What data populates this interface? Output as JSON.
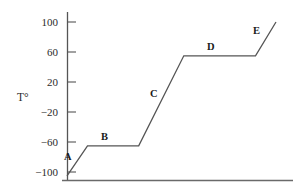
{
  "chart_data": {
    "type": "line",
    "title": "",
    "subtitle": "",
    "xlabel": "",
    "ylabel": "T°",
    "grid": false,
    "legend_position": "none",
    "ylim": [
      -110,
      110
    ],
    "yticks": [
      100,
      60,
      20,
      -20,
      -60,
      -100
    ],
    "ytick_labels": [
      "100",
      "60",
      "20",
      "−20",
      "−60",
      "−100"
    ],
    "xticks": [],
    "xtick_labels": [],
    "x_axis_visible": true,
    "y_axis_visible": true,
    "series": [
      {
        "name": "heating-curve",
        "points": [
          {
            "x": 0,
            "y": -105
          },
          {
            "x": 10,
            "y": -65
          },
          {
            "x": 35,
            "y": -65
          },
          {
            "x": 57,
            "y": 55
          },
          {
            "x": 92,
            "y": 55
          },
          {
            "x": 102,
            "y": 100
          }
        ]
      }
    ],
    "annotations": [
      {
        "label": "A",
        "x": 2,
        "y": -88
      },
      {
        "label": "B",
        "x": 20,
        "y": -53
      },
      {
        "label": "C",
        "x": 44,
        "y": 10
      },
      {
        "label": "D",
        "x": 73,
        "y": 67
      },
      {
        "label": "E",
        "x": 96,
        "y": 88
      }
    ],
    "colors": {
      "line": "#555555",
      "axis": "#555555",
      "text": "#2b2b2b"
    }
  },
  "axis": {
    "y_title": "T°",
    "tick_0": "100",
    "tick_1": "60",
    "tick_2": "20",
    "tick_3": "−20",
    "tick_4": "−60",
    "tick_5": "−100"
  },
  "segments": {
    "a": "A",
    "b": "B",
    "c": "C",
    "d": "D",
    "e": "E"
  }
}
